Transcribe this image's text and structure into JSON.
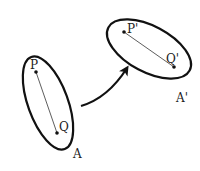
{
  "diagram": {
    "type": "set-mapping",
    "colors": {
      "stroke": "#111111",
      "text": "#222222",
      "background": "#ffffff"
    },
    "source_region": {
      "label": "A",
      "points": [
        {
          "label": "P"
        },
        {
          "label": "Q"
        }
      ]
    },
    "target_region": {
      "label": "A'",
      "points": [
        {
          "label": "P'"
        },
        {
          "label": "Q'"
        }
      ]
    },
    "mapping_arrow": {
      "from": "A",
      "to": "A'",
      "icon": "curved-arrow-icon"
    }
  }
}
